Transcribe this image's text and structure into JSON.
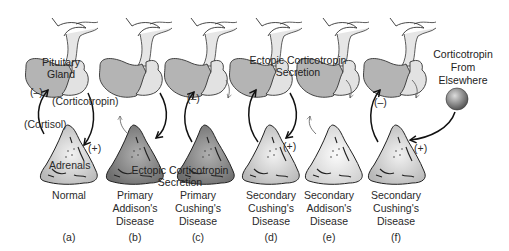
{
  "panels": [
    {
      "id": "a",
      "letter": "(a)",
      "caption": [
        "Normal"
      ]
    },
    {
      "id": "b",
      "letter": "(b)",
      "caption": [
        "Primary",
        "Addison's",
        "Disease"
      ]
    },
    {
      "id": "c",
      "letter": "(c)",
      "caption": [
        "Primary",
        "Cushing's",
        "Disease"
      ]
    },
    {
      "id": "d",
      "letter": "(d)",
      "caption": [
        "Secondary",
        "Cushing's",
        "Disease"
      ]
    },
    {
      "id": "e",
      "letter": "(e)",
      "caption": [
        "Secondary",
        "Addison's",
        "Disease"
      ]
    },
    {
      "id": "f",
      "letter": "(f)",
      "caption": [
        "Secondary",
        "Cushing's",
        "Disease"
      ]
    }
  ],
  "labels": {
    "pituitary_line1": "Pituitary",
    "pituitary_line2": "Gland",
    "adrenals": "Adrenals",
    "corticotropin": "(Corticotropin)",
    "cortisol": "(Cortisol)",
    "minus": "(–)",
    "plus": "(+)",
    "ectopic_line1": "Ectopic Corticotropin",
    "ectopic_line2": "Secretion",
    "elsewhere_line1": "Corticotropin",
    "elsewhere_line2": "From",
    "elsewhere_line3": "Elsewhere"
  },
  "colors": {
    "pituitary_anterior": "#b4b4b4",
    "pituitary_posterior": "#e2e2e2",
    "adrenal_normal": "#d6d6d6",
    "adrenal_dark": "#8c8c8c",
    "adrenal_light": "#ececec",
    "outline": "#333333",
    "arrow": "#111111"
  }
}
